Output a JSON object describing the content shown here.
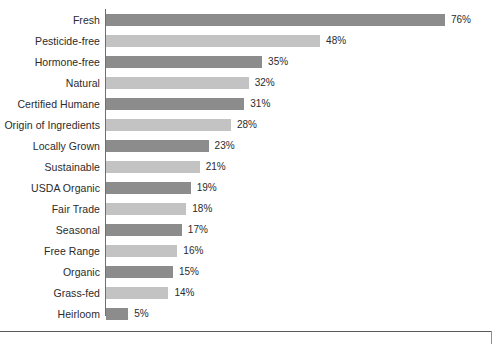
{
  "chart_data": {
    "type": "bar",
    "orientation": "horizontal",
    "title": "",
    "subtitle": "",
    "xlabel": "",
    "ylabel": "",
    "grid": false,
    "legend": null,
    "xlim": [
      0,
      76
    ],
    "value_suffix": "%",
    "categories": [
      "Fresh",
      "Pesticide-free",
      "Hormone-free",
      "Natural",
      "Certified Humane",
      "Origin of Ingredients",
      "Locally Grown",
      "Sustainable",
      "USDA Organic",
      "Fair Trade",
      "Seasonal",
      "Free Range",
      "Organic",
      "Grass-fed",
      "Heirloom"
    ],
    "values": [
      76,
      48,
      35,
      32,
      31,
      28,
      23,
      21,
      19,
      18,
      17,
      16,
      15,
      14,
      5
    ],
    "value_labels": [
      "76%",
      "48%",
      "35%",
      "32%",
      "31%",
      "28%",
      "23%",
      "21%",
      "19%",
      "18%",
      "17%",
      "16%",
      "15%",
      "14%",
      "5%"
    ],
    "colors": {
      "bar_dark": "#8c8c8c",
      "bar_light": "#c3c3c3",
      "axis_line": "#6f6f6f",
      "frame_rule": "#5a5a5a",
      "text": "#2b2b2b",
      "background": "#ffffff"
    },
    "bar_color_sequence": [
      "bar_dark",
      "bar_light",
      "bar_dark",
      "bar_light",
      "bar_dark",
      "bar_light",
      "bar_dark",
      "bar_light",
      "bar_dark",
      "bar_light",
      "bar_dark",
      "bar_light",
      "bar_dark",
      "bar_light",
      "bar_dark"
    ]
  }
}
